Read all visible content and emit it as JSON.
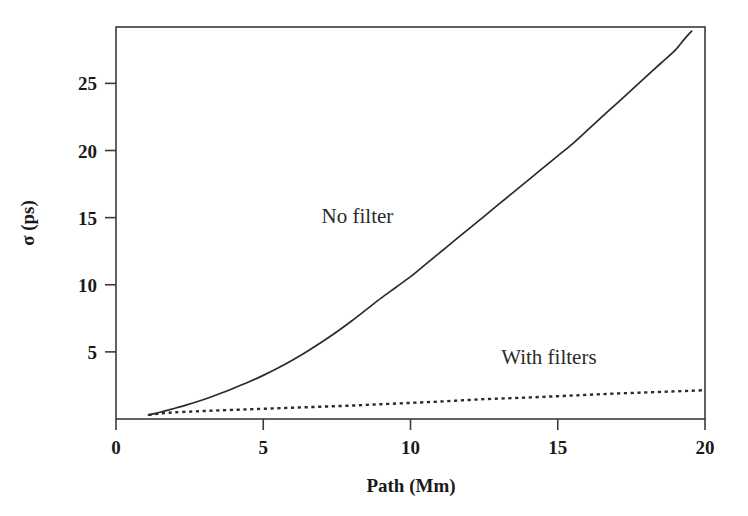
{
  "chart_data": {
    "type": "line",
    "title": "",
    "xlabel": "Path (Mm)",
    "ylabel": "σ (ps)",
    "xlim": [
      0,
      20
    ],
    "ylim": [
      0,
      29.2
    ],
    "xticks": [
      0,
      5,
      10,
      15,
      20
    ],
    "yticks": [
      5,
      10,
      15,
      20,
      25
    ],
    "xtick_labels": [
      "0",
      "5",
      "10",
      "15",
      "20"
    ],
    "ytick_labels": [
      "5",
      "10",
      "15",
      "20",
      "25"
    ],
    "grid": false,
    "legend_position": "inline-annotation",
    "series": [
      {
        "name": "No filter",
        "style": "solid",
        "annotation": "No filter",
        "annotation_x": 8.2,
        "annotation_y": 14.6,
        "x": [
          1.1,
          1.2,
          1.35,
          1.5,
          1.7,
          2.0,
          2.4,
          2.8,
          3.2,
          3.6,
          4.0,
          4.5,
          5.0,
          5.5,
          6.0,
          6.5,
          7.0,
          7.5,
          8.0,
          8.5,
          9.0,
          9.5,
          10.0,
          10.5,
          11.0,
          11.5,
          12.0,
          12.5,
          13.0,
          13.5,
          14.0,
          14.5,
          15.0,
          15.5,
          16.0,
          16.5,
          17.0,
          17.5,
          18.0,
          18.5,
          19.0,
          19.3,
          19.55
        ],
        "y": [
          0.3,
          0.35,
          0.42,
          0.5,
          0.62,
          0.8,
          1.05,
          1.32,
          1.62,
          1.95,
          2.3,
          2.75,
          3.25,
          3.8,
          4.4,
          5.05,
          5.75,
          6.5,
          7.3,
          8.15,
          9.0,
          9.8,
          10.6,
          11.5,
          12.4,
          13.3,
          14.2,
          15.1,
          16.0,
          16.9,
          17.8,
          18.7,
          19.6,
          20.5,
          21.5,
          22.5,
          23.5,
          24.5,
          25.5,
          26.5,
          27.5,
          28.3,
          28.9
        ]
      },
      {
        "name": "With filters",
        "style": "dotted",
        "annotation": "With filters",
        "annotation_x": 14.7,
        "annotation_y": 4.1,
        "x": [
          1.1,
          1.25,
          1.4,
          1.55,
          1.75,
          2.0,
          2.5,
          3.0,
          3.5,
          4.0,
          4.5,
          5.0,
          5.5,
          6.0,
          6.5,
          7.0,
          7.5,
          8.0,
          8.5,
          9.0,
          9.5,
          10.0,
          10.5,
          11.0,
          11.5,
          12.0,
          12.5,
          13.0,
          13.5,
          14.0,
          14.5,
          15.0,
          15.5,
          16.0,
          16.5,
          17.0,
          17.5,
          18.0,
          18.5,
          19.0,
          19.5,
          20.0
        ],
        "y": [
          0.3,
          0.34,
          0.38,
          0.42,
          0.46,
          0.5,
          0.55,
          0.6,
          0.64,
          0.68,
          0.72,
          0.76,
          0.8,
          0.84,
          0.88,
          0.92,
          0.96,
          1.0,
          1.05,
          1.1,
          1.15,
          1.2,
          1.25,
          1.3,
          1.36,
          1.42,
          1.48,
          1.52,
          1.56,
          1.6,
          1.65,
          1.7,
          1.75,
          1.8,
          1.85,
          1.9,
          1.94,
          1.98,
          2.02,
          2.06,
          2.1,
          2.15
        ]
      }
    ],
    "colors": {
      "axis": "#3b3b3b",
      "series_no_filter": "#2b2b2b",
      "series_with_filters": "#2b2b2b",
      "background": "#ffffff",
      "text": "#1a1a1a"
    }
  }
}
